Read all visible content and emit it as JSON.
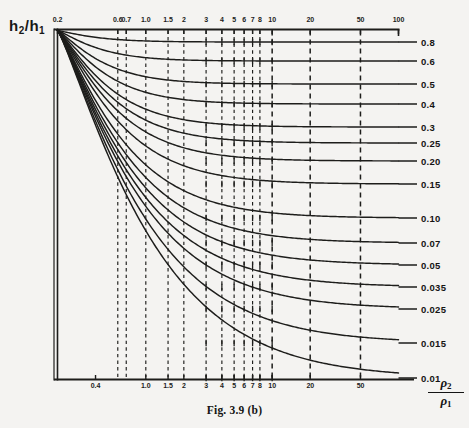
{
  "figure": {
    "caption": "Fig. 3.9 (b)",
    "y_axis_label": {
      "main": "h",
      "sub1": "2",
      "slash": "/",
      "main2": "h",
      "sub2": "1",
      "text": "h2/h1"
    },
    "x_axis_label": {
      "numerator": "ρ",
      "numerator_sub": "2",
      "denominator": "ρ",
      "denominator_sub": "1",
      "text": "ρ2/ρ1"
    },
    "ink_color": "#1b1b1b",
    "paper_color": "#f4f3f1"
  },
  "chart_data": {
    "type": "line",
    "title": "Fig. 3.9 (b)",
    "xlabel": "ρ2/ρ1",
    "ylabel": "h2/h1",
    "xscale": "log",
    "yscale": "linear",
    "grid": true,
    "grid_style": "dashed vertical gridlines at labelled x ticks",
    "legend": "none (curves labelled at right edge)",
    "xlim": [
      0.2,
      100
    ],
    "ylim": [
      0.01,
      1.0
    ],
    "x_ticks_top": [
      {
        "label": "0.2",
        "value": 0.2
      },
      {
        "label": "0.6",
        "value": 0.6
      },
      {
        "label": "0.7",
        "value": 0.7
      },
      {
        "label": "1.0",
        "value": 1.0
      },
      {
        "label": "1.5",
        "value": 1.5
      },
      {
        "label": "2",
        "value": 2
      },
      {
        "label": "3",
        "value": 3
      },
      {
        "label": "4",
        "value": 4
      },
      {
        "label": "5",
        "value": 5
      },
      {
        "label": "6",
        "value": 6
      },
      {
        "label": "7",
        "value": 7
      },
      {
        "label": "8",
        "value": 8
      },
      {
        "label": "10",
        "value": 10
      },
      {
        "label": "20",
        "value": 20
      },
      {
        "label": "50",
        "value": 50
      },
      {
        "label": "100",
        "value": 100
      }
    ],
    "x_ticks_bottom": [
      {
        "label": "0.4",
        "value": 0.4
      },
      {
        "label": "1.0",
        "value": 1.0
      },
      {
        "label": "1.5",
        "value": 1.5
      },
      {
        "label": "2",
        "value": 2
      },
      {
        "label": "3",
        "value": 3
      },
      {
        "label": "4",
        "value": 4
      },
      {
        "label": "5",
        "value": 5
      },
      {
        "label": "6",
        "value": 6
      },
      {
        "label": "7",
        "value": 7
      },
      {
        "label": "8",
        "value": 8
      },
      {
        "label": "10",
        "value": 10
      },
      {
        "label": "20",
        "value": 20
      },
      {
        "label": "50",
        "value": 50
      }
    ],
    "curve_labels": [
      "0.8",
      "0.6",
      "0.5",
      "0.4",
      "0.3",
      "0.25",
      "0.20",
      "0.15",
      "0.10",
      "0.07",
      "0.05",
      "0.035",
      "0.025",
      "0.015",
      "0.01"
    ],
    "series": [
      {
        "name": "0.8",
        "value": 0.8,
        "plateau": 0.8,
        "label_y": 42
      },
      {
        "name": "0.6",
        "value": 0.6,
        "plateau": 0.6,
        "label_y": 61
      },
      {
        "name": "0.5",
        "value": 0.5,
        "plateau": 0.5,
        "label_y": 84
      },
      {
        "name": "0.4",
        "value": 0.4,
        "plateau": 0.4,
        "label_y": 104
      },
      {
        "name": "0.3",
        "value": 0.3,
        "plateau": 0.3,
        "label_y": 127
      },
      {
        "name": "0.25",
        "value": 0.25,
        "plateau": 0.25,
        "label_y": 143
      },
      {
        "name": "0.20",
        "value": 0.2,
        "plateau": 0.2,
        "label_y": 161
      },
      {
        "name": "0.15",
        "value": 0.15,
        "plateau": 0.15,
        "label_y": 184
      },
      {
        "name": "0.10",
        "value": 0.1,
        "plateau": 0.1,
        "label_y": 218
      },
      {
        "name": "0.07",
        "value": 0.07,
        "plateau": 0.07,
        "label_y": 243
      },
      {
        "name": "0.05",
        "value": 0.05,
        "plateau": 0.05,
        "label_y": 265
      },
      {
        "name": "0.035",
        "value": 0.035,
        "plateau": 0.035,
        "label_y": 287
      },
      {
        "name": "0.025",
        "value": 0.025,
        "plateau": 0.025,
        "label_y": 309
      },
      {
        "name": "0.015",
        "value": 0.015,
        "plateau": 0.015,
        "label_y": 343
      },
      {
        "name": "0.01",
        "value": 0.01,
        "plateau": 0.01,
        "label_y": 378
      }
    ],
    "annotations": [
      "All curves originate from a common point at the top-left corner of the frame",
      "Each curve falls steeply then flattens to a horizontal asymptote equal to its h2/h1 label value",
      "Dashed vertical gridlines mark the labelled abscissa values"
    ]
  }
}
